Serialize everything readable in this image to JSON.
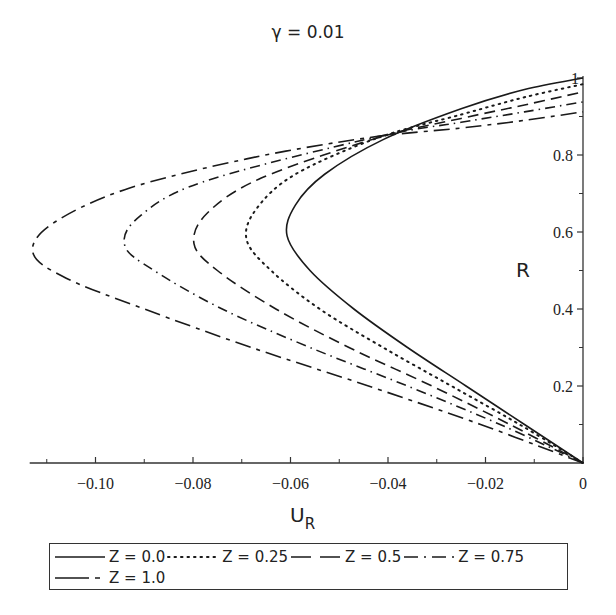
{
  "chart_data": {
    "type": "line",
    "title": "γ = 0.01",
    "xlabel": "U_R",
    "ylabel": "R",
    "xlim": [
      -0.1135,
      0
    ],
    "ylim": [
      0,
      1
    ],
    "grid": false,
    "legend_position": "bottom",
    "x_ticks": [
      {
        "value": -0.1,
        "label": "−0.10"
      },
      {
        "value": -0.08,
        "label": "−0.08"
      },
      {
        "value": -0.06,
        "label": "−0.06"
      },
      {
        "value": -0.04,
        "label": "−0.04"
      },
      {
        "value": -0.02,
        "label": "−0.02"
      },
      {
        "value": 0,
        "label": "0"
      }
    ],
    "x_minor_ticks": [
      -0.11,
      -0.09,
      -0.07,
      -0.05,
      -0.03,
      -0.01
    ],
    "y_ticks": [
      {
        "value": 0.2,
        "label": "0.2"
      },
      {
        "value": 0.4,
        "label": "0.4"
      },
      {
        "value": 0.6,
        "label": "0.6"
      },
      {
        "value": 0.8,
        "label": "0.8"
      },
      {
        "value": 1.0,
        "label": "1"
      }
    ],
    "y_minor_ticks": [
      0.1,
      0.3,
      0.5,
      0.7,
      0.9
    ],
    "series": [
      {
        "name": "Z = 0.0",
        "style": "solid",
        "points": [
          [
            0,
            0
          ],
          [
            -0.012,
            0.1
          ],
          [
            -0.024,
            0.2
          ],
          [
            -0.036,
            0.3
          ],
          [
            -0.047,
            0.4
          ],
          [
            -0.056,
            0.5
          ],
          [
            -0.0607,
            0.59
          ],
          [
            -0.059,
            0.67
          ],
          [
            -0.053,
            0.75
          ],
          [
            -0.041,
            0.84
          ],
          [
            -0.025,
            0.92
          ],
          [
            -0.012,
            0.97
          ],
          [
            0,
            1.0
          ]
        ]
      },
      {
        "name": "Z = 0.25",
        "style": "dotted",
        "points": [
          [
            0,
            0
          ],
          [
            -0.013,
            0.1
          ],
          [
            -0.027,
            0.2
          ],
          [
            -0.041,
            0.3
          ],
          [
            -0.054,
            0.4
          ],
          [
            -0.064,
            0.5
          ],
          [
            -0.069,
            0.58
          ],
          [
            -0.067,
            0.66
          ],
          [
            -0.059,
            0.75
          ],
          [
            -0.042,
            0.845
          ],
          [
            -0.025,
            0.905
          ],
          [
            -0.012,
            0.95
          ],
          [
            0,
            0.984
          ]
        ]
      },
      {
        "name": "Z = 0.5",
        "style": "dashed",
        "points": [
          [
            0,
            0
          ],
          [
            -0.015,
            0.1
          ],
          [
            -0.031,
            0.2
          ],
          [
            -0.048,
            0.3
          ],
          [
            -0.063,
            0.4
          ],
          [
            -0.075,
            0.5
          ],
          [
            -0.0798,
            0.57
          ],
          [
            -0.077,
            0.65
          ],
          [
            -0.066,
            0.74
          ],
          [
            -0.042,
            0.845
          ],
          [
            -0.025,
            0.895
          ],
          [
            -0.012,
            0.93
          ],
          [
            0,
            0.964
          ]
        ]
      },
      {
        "name": "Z = 0.75",
        "style": "dash-dot",
        "points": [
          [
            0,
            0
          ],
          [
            -0.017,
            0.1
          ],
          [
            -0.036,
            0.2
          ],
          [
            -0.056,
            0.3
          ],
          [
            -0.074,
            0.4
          ],
          [
            -0.088,
            0.5
          ],
          [
            -0.094,
            0.565
          ],
          [
            -0.091,
            0.64
          ],
          [
            -0.078,
            0.73
          ],
          [
            -0.043,
            0.845
          ],
          [
            -0.025,
            0.885
          ],
          [
            -0.012,
            0.912
          ],
          [
            0,
            0.938
          ]
        ]
      },
      {
        "name": "Z = 1.0",
        "style": "long-dash-short-dash",
        "points": [
          [
            0,
            0
          ],
          [
            -0.021,
            0.1
          ],
          [
            -0.044,
            0.2
          ],
          [
            -0.068,
            0.3
          ],
          [
            -0.09,
            0.4
          ],
          [
            -0.106,
            0.48
          ],
          [
            -0.1128,
            0.545
          ],
          [
            -0.109,
            0.62
          ],
          [
            -0.094,
            0.71
          ],
          [
            -0.069,
            0.79
          ],
          [
            -0.044,
            0.845
          ],
          [
            -0.025,
            0.87
          ],
          [
            -0.012,
            0.89
          ],
          [
            0,
            0.912
          ]
        ]
      }
    ]
  },
  "legend": {
    "row1": [
      "Z = 0.0",
      "Z = 0.25",
      "Z = 0.5",
      "Z = 0.75"
    ],
    "row2": [
      "Z = 1.0"
    ]
  }
}
